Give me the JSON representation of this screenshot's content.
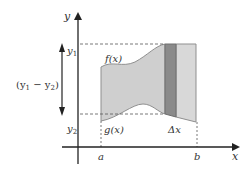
{
  "diagram": {
    "type": "area-between-curves",
    "labels": {
      "y_axis": "y",
      "x_axis": "x",
      "y1": "y",
      "y1_sub": "1",
      "y2": "y",
      "y2_sub": "2",
      "difference": "(y",
      "difference_sub1": "1",
      "difference_mid": " − y",
      "difference_sub2": "2",
      "difference_close": ")",
      "upper_curve": "f(x)",
      "lower_curve": "g(x)",
      "strip_width": "Δx",
      "a": "a",
      "b": "b"
    },
    "colors": {
      "region_fill": "#cfcfcf",
      "region_edge": "#8f8f8f",
      "strip_dark": "#8a8a8a",
      "strip_light": "#d8d8d8",
      "axis": "#222222",
      "dashed": "#555555"
    }
  }
}
